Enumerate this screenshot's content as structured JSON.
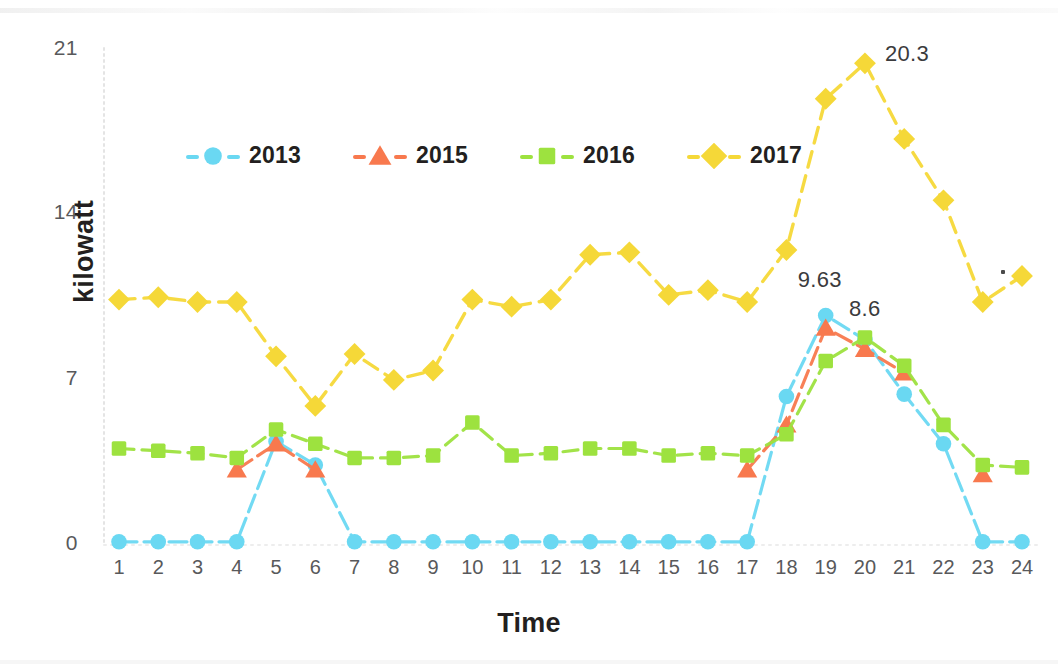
{
  "chart_data": {
    "type": "line",
    "title": "",
    "xlabel": "Time",
    "ylabel": "kilowatt",
    "x": [
      1,
      2,
      3,
      4,
      5,
      6,
      7,
      8,
      9,
      10,
      11,
      12,
      13,
      14,
      15,
      16,
      17,
      18,
      19,
      20,
      21,
      22,
      23,
      24
    ],
    "categories": [
      "1",
      "2",
      "3",
      "4",
      "5",
      "6",
      "7",
      "8",
      "9",
      "10",
      "11",
      "12",
      "13",
      "14",
      "15",
      "16",
      "17",
      "18",
      "19",
      "20",
      "21",
      "22",
      "23",
      "24"
    ],
    "xtick_labels": [
      "1",
      "2",
      "3",
      "4",
      "5",
      "6",
      "7",
      "8",
      "9",
      "10",
      "11",
      "12",
      "13",
      "14",
      "15",
      "16",
      "17",
      "18",
      "19",
      "20",
      "21",
      "22",
      "23",
      "24"
    ],
    "ytick_labels": [
      "0",
      "7",
      "14",
      "21"
    ],
    "yticks": [
      0,
      7,
      14,
      21
    ],
    "ylim": [
      0,
      21
    ],
    "xlim": [
      1,
      24
    ],
    "grid": false,
    "legend_position": "upper-left-inside",
    "series": [
      {
        "name": "2013",
        "color": "#6ad8f2",
        "marker": "circle",
        "values": [
          0.05,
          0.05,
          0.05,
          0.05,
          4.3,
          3.3,
          0.05,
          0.05,
          0.05,
          0.05,
          0.05,
          0.05,
          0.05,
          0.05,
          0.05,
          0.05,
          0.05,
          6.2,
          9.63,
          8.6,
          6.3,
          4.2,
          0.05,
          0.05
        ]
      },
      {
        "name": "2015",
        "color": "#f8794e",
        "marker": "triangle",
        "values": [
          null,
          null,
          null,
          3.1,
          4.2,
          3.1,
          null,
          null,
          null,
          null,
          null,
          null,
          null,
          null,
          null,
          null,
          3.1,
          5.0,
          9.1,
          8.2,
          7.2,
          null,
          2.9,
          null
        ]
      },
      {
        "name": "2016",
        "color": "#9de23f",
        "marker": "square",
        "values": [
          4.0,
          3.9,
          3.8,
          3.6,
          4.8,
          4.2,
          3.6,
          3.6,
          3.7,
          5.1,
          3.7,
          3.8,
          4.0,
          4.0,
          3.7,
          3.8,
          3.7,
          4.6,
          7.7,
          8.7,
          7.5,
          5.0,
          3.3,
          3.2
        ]
      },
      {
        "name": "2017",
        "color": "#f5d838",
        "marker": "diamond",
        "values": [
          10.3,
          10.4,
          10.2,
          10.2,
          7.9,
          5.8,
          8.0,
          6.9,
          7.3,
          10.3,
          10.0,
          10.3,
          12.2,
          12.3,
          10.5,
          10.7,
          10.2,
          12.4,
          18.8,
          20.3,
          17.1,
          14.5,
          10.2,
          11.3
        ]
      }
    ],
    "annotations": [
      {
        "text": "9.63",
        "series": "2013",
        "x": 19,
        "y": 9.63
      },
      {
        "text": "8.6",
        "series": "2013",
        "x": 20,
        "y": 8.6
      },
      {
        "text": "20.3",
        "series": "2017",
        "x": 20,
        "y": 20.3
      }
    ]
  },
  "axes": {
    "y_title": "kilowatt",
    "x_title": "Time"
  },
  "legend": {
    "items": [
      {
        "label": "2013",
        "color": "#6ad8f2",
        "marker": "circle-icon"
      },
      {
        "label": "2015",
        "color": "#f8794e",
        "marker": "triangle-icon"
      },
      {
        "label": "2016",
        "color": "#9de23f",
        "marker": "square-icon"
      },
      {
        "label": "2017",
        "color": "#f5d838",
        "marker": "diamond-icon"
      }
    ]
  },
  "colors": {
    "series_2013": "#6ad8f2",
    "series_2015": "#f8794e",
    "series_2016": "#9de23f",
    "series_2017": "#f5d838",
    "axis_text": "#58595b",
    "title_text": "#231f20",
    "annotation_text": "#3b3b3d",
    "axis_line": "#e4e4e4"
  }
}
